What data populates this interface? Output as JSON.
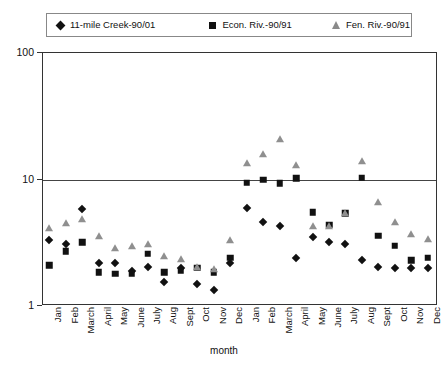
{
  "chart_data": {
    "type": "scatter",
    "title": "",
    "xlabel": "month",
    "ylabel": "",
    "yscale": "log",
    "ylim": [
      1,
      100
    ],
    "ytick_labels": [
      "100",
      "10",
      "1"
    ],
    "ytick_values": [
      100,
      10,
      1
    ],
    "grid": "horizontal-at-10",
    "legend_position": "top",
    "categories": [
      "Jan",
      "Feb",
      "March",
      "April",
      "May",
      "June",
      "July",
      "Aug",
      "Sept",
      "Oct",
      "Nov",
      "Dec",
      "Jan",
      "Feb",
      "March",
      "April",
      "May",
      "June",
      "July",
      "Aug",
      "Sept",
      "Oct",
      "Nov",
      "Dec"
    ],
    "series": [
      {
        "name": "11-mile Creek-90/01",
        "marker": "diamond",
        "color": "#111111",
        "values": [
          3.3,
          3.1,
          5.8,
          2.2,
          2.2,
          1.9,
          2.05,
          1.55,
          2.0,
          1.5,
          1.35,
          2.2,
          6.0,
          4.6,
          4.3,
          2.4,
          3.5,
          3.2,
          3.1,
          2.3,
          2.05,
          2.0,
          2.0,
          2.0
        ]
      },
      {
        "name": "Econ. Riv.-90/91",
        "marker": "square",
        "color": "#111111",
        "values": [
          2.1,
          2.7,
          3.2,
          1.85,
          1.8,
          1.8,
          2.6,
          1.85,
          1.9,
          2.0,
          1.85,
          2.4,
          9.4,
          10.0,
          9.3,
          10.2,
          5.5,
          4.4,
          5.4,
          10.3,
          3.6,
          3.0,
          2.3,
          2.4
        ]
      },
      {
        "name": "Fen. Riv.-90/91",
        "marker": "triangle",
        "color": "#8f8f8f",
        "values": [
          4.1,
          4.5,
          4.9,
          3.6,
          2.9,
          3.0,
          3.1,
          2.5,
          2.35,
          2.05,
          1.95,
          3.3,
          13.5,
          16.0,
          21.0,
          13.0,
          4.3,
          4.3,
          5.4,
          14.0,
          6.7,
          4.6,
          3.7,
          3.4
        ]
      }
    ]
  },
  "legend": {
    "items": [
      {
        "label": "11-mile Creek-90/01",
        "marker": "diamond"
      },
      {
        "label": "Econ. Riv.-90/91",
        "marker": "square"
      },
      {
        "label": "Fen. Riv.-90/91",
        "marker": "triangle"
      }
    ]
  },
  "axis": {
    "x_title": "month"
  }
}
